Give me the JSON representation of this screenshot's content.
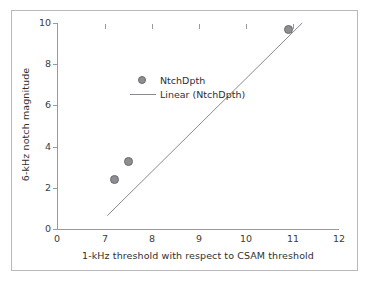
{
  "chart_data": {
    "type": "scatter",
    "title": "",
    "xlabel": "1-kHz threshold with respect to CSAM threshold",
    "ylabel": "6-kHz notch magnitude",
    "grid": false,
    "legend_position": "upper-left-inside",
    "x_ticks": [
      "0",
      "7",
      "8",
      "9",
      "10",
      "11",
      "12"
    ],
    "y_ticks": [
      "0",
      "2",
      "4",
      "6",
      "8",
      "10"
    ],
    "xlim": [
      0,
      12
    ],
    "ylim": [
      0,
      10
    ],
    "x_axis_note": "axis break between 0 and 7; ticks evenly spaced",
    "series": [
      {
        "name": "NtchDpth",
        "type": "scatter",
        "marker": "circle",
        "color": "#8e8e92",
        "points": [
          {
            "x": 7.2,
            "y": 2.4
          },
          {
            "x": 7.5,
            "y": 3.3
          },
          {
            "x": 10.9,
            "y": 9.7
          }
        ]
      },
      {
        "name": "Linear (NtchDpth)",
        "type": "line",
        "color": "#8a8a8e",
        "endpoints": [
          {
            "x": 7.05,
            "y": 0.65
          },
          {
            "x": 11.2,
            "y": 10.0
          }
        ]
      }
    ]
  },
  "legend": {
    "entries": [
      {
        "label": "NtchDpth",
        "key": "marker"
      },
      {
        "label": "Linear (NtchDpth)",
        "key": "line"
      }
    ]
  }
}
